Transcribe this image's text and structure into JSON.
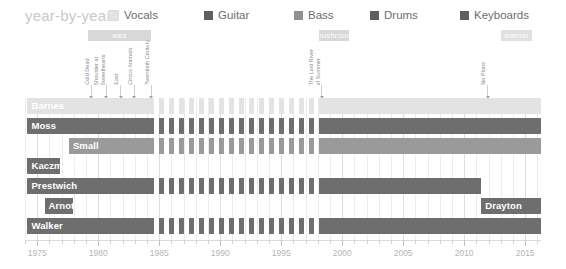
{
  "header": {
    "title": "year-by-year"
  },
  "legend": {
    "items": [
      {
        "label": "Vocals",
        "color": "#e3e3e3",
        "x": 0
      },
      {
        "label": "Guitar",
        "color": "#5f5f5f",
        "x": 96
      },
      {
        "label": "Bass",
        "color": "#8f8f8f",
        "x": 186
      },
      {
        "label": "Drums",
        "color": "#5f5f5f",
        "x": 262
      },
      {
        "label": "Keyboards",
        "color": "#5f5f5f",
        "x": 352
      }
    ]
  },
  "labels": {
    "bands": [
      {
        "name": "wea",
        "color": "#d8d8d8",
        "start": 1979.2,
        "end": 1984.3
      },
      {
        "name": "mushroom",
        "color": "#d8d8d8",
        "start": 1998.1,
        "end": 2000.6
      },
      {
        "name": "warner",
        "color": "#e0e0e0",
        "start": 2013.0,
        "end": 2015.6
      }
    ]
  },
  "annotations": [
    {
      "text": "Cold Dead",
      "year": 1979.4,
      "lines": 1
    },
    {
      "text": "Shoulder at Sweethearts",
      "year": 1980.6,
      "lines": 2
    },
    {
      "text": "East",
      "year": 1981.8,
      "lines": 1
    },
    {
      "text": "Circus Animals",
      "year": 1982.9,
      "lines": 1
    },
    {
      "text": "Twentieth Century",
      "year": 1984.3,
      "lines": 1
    },
    {
      "text": "The Last River of Summer",
      "year": 1998.3,
      "lines": 2
    },
    {
      "text": "No Plans",
      "year": 2011.9,
      "lines": 1
    }
  ],
  "chart_data": {
    "type": "timeline",
    "title": "year-by-year",
    "xlabel": "",
    "ylabel": "",
    "xlim": [
      1974.0,
      2016.3
    ],
    "grid": true,
    "legend_position": "top",
    "tick_years": [
      1975,
      1980,
      1985,
      1990,
      1995,
      2000,
      2005,
      2010,
      2015
    ],
    "minor_tick_step": 1,
    "rows": [
      {
        "name": "Barnes",
        "role": "Vocals",
        "color": "#e3e3e3",
        "label_color": "#b9b9b9",
        "label_align": "left",
        "segments": [
          {
            "start": 1974.2,
            "end": 1984.2,
            "style": "solid"
          },
          {
            "start": 1984.2,
            "end": 1998.1,
            "style": "striped"
          },
          {
            "start": 1998.1,
            "end": 2016.3,
            "style": "solid"
          }
        ]
      },
      {
        "name": "Moss",
        "role": "Guitar",
        "color": "#6e6e6e",
        "label_color": "#6e6e6e",
        "label_align": "left",
        "segments": [
          {
            "start": 1974.2,
            "end": 1984.2,
            "style": "solid"
          },
          {
            "start": 1984.2,
            "end": 1998.1,
            "style": "striped"
          },
          {
            "start": 1998.1,
            "end": 2016.3,
            "style": "solid"
          }
        ]
      },
      {
        "name": "Small",
        "role": "Bass",
        "color": "#9a9a9a",
        "label_color": "#9a9a9a",
        "label_align": "left",
        "segments": [
          {
            "start": 1977.6,
            "end": 1984.2,
            "style": "solid"
          },
          {
            "start": 1984.2,
            "end": 1998.1,
            "style": "striped"
          },
          {
            "start": 1998.1,
            "end": 2016.3,
            "style": "solid"
          }
        ]
      },
      {
        "name": "Kaczmarek",
        "role": "Keyboards",
        "color": "#6e6e6e",
        "label_color": "#6e6e6e",
        "label_align": "left",
        "segments": [
          {
            "start": 1974.2,
            "end": 1976.9,
            "style": "solid"
          }
        ]
      },
      {
        "name": "Prestwich",
        "role": "Drums",
        "color": "#6e6e6e",
        "label_color": "#6e6e6e",
        "label_align": "left",
        "segments": [
          {
            "start": 1974.2,
            "end": 1984.2,
            "style": "solid"
          },
          {
            "start": 1984.2,
            "end": 1998.1,
            "style": "striped"
          },
          {
            "start": 1998.1,
            "end": 2011.4,
            "style": "solid"
          }
        ]
      },
      {
        "name": "Arnott",
        "role": "Drums",
        "color": "#6e6e6e",
        "label_color": "#6e6e6e",
        "label_align": "left",
        "segments": [
          {
            "start": 1975.6,
            "end": 1977.9,
            "style": "solid"
          }
        ]
      },
      {
        "name": "Drayton",
        "role": "Drums",
        "color": "#6e6e6e",
        "label_color": "#6e6e6e",
        "label_align": "left",
        "same_row_as": "Arnott",
        "segments": [
          {
            "start": 2011.4,
            "end": 2016.3,
            "style": "solid"
          }
        ]
      },
      {
        "name": "Walker",
        "role": "Guitar",
        "color": "#6e6e6e",
        "label_color": "#6e6e6e",
        "label_align": "left",
        "segments": [
          {
            "start": 1974.2,
            "end": 1984.2,
            "style": "solid"
          },
          {
            "start": 1984.2,
            "end": 1998.1,
            "style": "striped"
          },
          {
            "start": 1998.1,
            "end": 2016.3,
            "style": "solid"
          }
        ]
      }
    ]
  }
}
